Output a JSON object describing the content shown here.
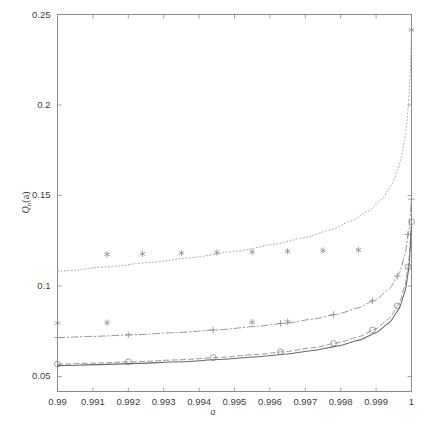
{
  "chart_data": {
    "type": "line",
    "title": "",
    "xlabel": "a",
    "ylabel_base": "Q",
    "ylabel_sub": "n",
    "ylabel_arg": "(a)",
    "xlim": [
      0.99,
      1.0
    ],
    "ylim": [
      0.0417,
      0.25
    ],
    "grid": false,
    "legend": "none",
    "xticks": [
      0.99,
      0.991,
      0.992,
      0.993,
      0.994,
      0.995,
      0.996,
      0.997,
      0.998,
      0.999,
      1
    ],
    "xtick_labels": [
      "0.99",
      "0.991",
      "0.992",
      "0.993",
      "0.994",
      "0.995",
      "0.996",
      "0.997",
      "0.998",
      "0.999",
      "1"
    ],
    "yticks": [
      0.05,
      0.1,
      0.15,
      0.2,
      0.25
    ],
    "ytick_labels": [
      "0.05",
      "0.1",
      "0.15",
      "0.2",
      "0.25"
    ],
    "series": [
      {
        "name": "dotted-upper",
        "style": "dotted",
        "marker": "none",
        "color": "#9a9a9a",
        "x": [
          0.99,
          0.9912,
          0.9924,
          0.9936,
          0.9948,
          0.996,
          0.9968,
          0.9976,
          0.9982,
          0.9987,
          0.9991,
          0.9994,
          0.9996,
          0.9997,
          0.9998,
          0.99985,
          0.9999,
          0.99995,
          1.0
        ],
        "y": [
          0.1082,
          0.1104,
          0.1128,
          0.1155,
          0.1188,
          0.1228,
          0.1262,
          0.1306,
          0.1355,
          0.1408,
          0.1472,
          0.1552,
          0.1638,
          0.1705,
          0.1805,
          0.1878,
          0.1975,
          0.2135,
          0.2415
        ]
      },
      {
        "name": "asterisk-upper",
        "style": "none",
        "marker": "asterisk",
        "color": "#8c8c8c",
        "x": [
          0.9914,
          0.9924,
          0.9935,
          0.9945,
          0.9955,
          0.9965,
          0.9975,
          0.9985,
          1.0
        ],
        "y": [
          0.1175,
          0.1178,
          0.1182,
          0.1185,
          0.1188,
          0.1192,
          0.1196,
          0.12,
          0.2415
        ]
      },
      {
        "name": "asterisk-lower",
        "style": "none",
        "marker": "asterisk",
        "color": "#8c8c8c",
        "x": [
          0.99,
          0.9914,
          0.9955,
          0.9965
        ],
        "y": [
          0.0795,
          0.0798,
          0.08,
          0.0802
        ]
      },
      {
        "name": "dashdot-plus",
        "style": "dashdot",
        "marker": "plus",
        "color": "#8c8c8c",
        "x": [
          0.99,
          0.9908,
          0.992,
          0.9932,
          0.9944,
          0.9954,
          0.9963,
          0.9971,
          0.9978,
          0.9984,
          0.9989,
          0.9993,
          0.9996,
          0.9998,
          0.9999,
          1.0
        ],
        "y": [
          0.0715,
          0.0721,
          0.073,
          0.0742,
          0.0757,
          0.0774,
          0.0793,
          0.0815,
          0.0842,
          0.0876,
          0.0918,
          0.0975,
          0.1055,
          0.1165,
          0.1285,
          0.148
        ]
      },
      {
        "name": "dashed-circle",
        "style": "dashed",
        "marker": "circle",
        "color": "#8c8c8c",
        "x": [
          0.99,
          0.9908,
          0.992,
          0.9932,
          0.9944,
          0.9954,
          0.9963,
          0.9971,
          0.9978,
          0.9984,
          0.9989,
          0.9993,
          0.9996,
          0.9998,
          0.9999,
          1.0
        ],
        "y": [
          0.0568,
          0.0573,
          0.0581,
          0.0591,
          0.0604,
          0.0619,
          0.0636,
          0.0657,
          0.0683,
          0.0715,
          0.0757,
          0.0812,
          0.089,
          0.0995,
          0.1105,
          0.1355
        ]
      },
      {
        "name": "solid-lower",
        "style": "solid",
        "marker": "none",
        "color": "#6a6a6a",
        "x": [
          0.99,
          0.9908,
          0.992,
          0.9932,
          0.9944,
          0.9954,
          0.9963,
          0.9971,
          0.9978,
          0.9984,
          0.9989,
          0.9993,
          0.9996,
          0.9998,
          0.9999,
          1.0
        ],
        "y": [
          0.056,
          0.0564,
          0.0571,
          0.058,
          0.0592,
          0.0606,
          0.0622,
          0.0641,
          0.0665,
          0.0696,
          0.0735,
          0.0788,
          0.0862,
          0.0962,
          0.1068,
          0.133
        ]
      }
    ],
    "markers_asterisk_standalone": {
      "comment": "asterisk series plotted at widely spaced x positions"
    }
  }
}
